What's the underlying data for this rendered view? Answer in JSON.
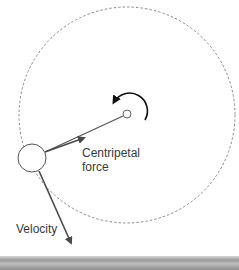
{
  "diagram": {
    "labels": {
      "centripetal_line1": "Centripetal",
      "centripetal_line2": "force",
      "velocity": "Velocity"
    },
    "colors": {
      "orbit": "#8a8a8a",
      "arrow": "#4a4a4a",
      "rotation_arrow": "#111111",
      "circle_stroke": "#555555",
      "text": "#3a3a3a",
      "bottom_bar": "#9a9a9a"
    },
    "elements": {
      "orbit_path": "dashed circle",
      "center_point": "small circle",
      "mass": "large circle",
      "rotation_direction": "counter-clockwise",
      "centripetal_force_arrow": "points toward center",
      "velocity_arrow": "tangent to orbit"
    }
  }
}
